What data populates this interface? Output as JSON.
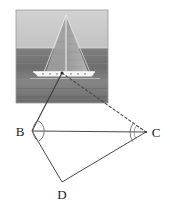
{
  "figure": {
    "photo": {
      "alt_name": "sailboat-photo",
      "sky_color": "#b9b9b9",
      "sky_top_color": "#c8c8c8",
      "sea_color": "#7d7d7d",
      "sea_dark_color": "#6a6a6a",
      "sail_color": "#a3a3a3",
      "hull_color": "#f2f2f2",
      "border_color": "#9a9a9a",
      "x": 16,
      "y": 10,
      "width": 92,
      "height": 93,
      "horizon_y": 48
    },
    "colors": {
      "line": "#4a4a4a",
      "dashed_line": "#5a5a5a",
      "arc": "#6b6b6b",
      "label": "#1b1b1b",
      "background": "#ffffff"
    },
    "points": [
      {
        "name": "A",
        "label": "",
        "x": 62,
        "y": 73,
        "visible_label": false
      },
      {
        "name": "B",
        "label": "B",
        "x": 32,
        "y": 131,
        "label_x": 20,
        "label_y": 136
      },
      {
        "name": "C",
        "label": "C",
        "x": 146,
        "y": 132,
        "label_x": 152,
        "label_y": 137
      },
      {
        "name": "D",
        "label": "D",
        "x": 62,
        "y": 182,
        "label_x": 57,
        "label_y": 199
      }
    ],
    "segments": [
      {
        "name": "boat-to-B",
        "from": "A",
        "to": "B",
        "style": "solid"
      },
      {
        "name": "boat-to-C",
        "from": "A",
        "to": "C",
        "style": "dashed"
      },
      {
        "name": "B-to-C",
        "from": "B",
        "to": "C",
        "style": "solid"
      },
      {
        "name": "B-to-D",
        "from": "B",
        "to": "D",
        "style": "solid"
      },
      {
        "name": "D-to-C",
        "from": "D",
        "to": "C",
        "style": "solid"
      }
    ],
    "angle_arcs": [
      {
        "name": "angle-at-B",
        "vertex": "B",
        "radius": 11
      },
      {
        "name": "angle-at-C",
        "vertex": "C",
        "radius": 13
      }
    ]
  }
}
